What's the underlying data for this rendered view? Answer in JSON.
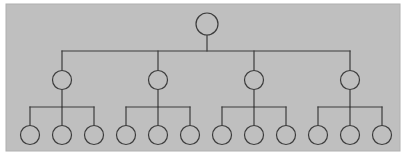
{
  "figure": {
    "kind": "tree-diagram",
    "title": "",
    "caption": ""
  },
  "canvas": {
    "width": 415,
    "height": 159,
    "background_color": "#ffffff"
  },
  "panel": {
    "x": 6,
    "y": 4,
    "width": 394,
    "height": 147,
    "fill_color": "#bfbfbf",
    "border_color": "#b0b0b0",
    "border_width": 1
  },
  "style": {
    "stroke_color": "#3c3c3c",
    "stroke_width": 1.2,
    "node_fill": "#bfbfbf",
    "node_stroke": "#3c3c3c",
    "node_stroke_width": 1.2
  },
  "chart_data": {
    "type": "tree",
    "levels": 3,
    "node_radius": {
      "root": 11,
      "level2": 9.5,
      "leaf": 9.5
    },
    "level_y": {
      "root": 24,
      "level2": 80,
      "leaf": 135
    },
    "connector_y": {
      "root_bar": 51,
      "branch_bar": 107
    },
    "nodes": {
      "root": [
        {
          "id": "r",
          "label": "",
          "x": 207,
          "y": 24,
          "r": 11
        }
      ],
      "level2": [
        {
          "id": "b1",
          "label": "",
          "x": 62,
          "y": 80,
          "r": 9.5
        },
        {
          "id": "b2",
          "label": "",
          "x": 158,
          "y": 80,
          "r": 9.5
        },
        {
          "id": "b3",
          "label": "",
          "x": 254,
          "y": 80,
          "r": 9.5
        },
        {
          "id": "b4",
          "label": "",
          "x": 350,
          "y": 80,
          "r": 9.5
        }
      ],
      "leaves": [
        {
          "id": "l1",
          "label": "",
          "x": 30,
          "y": 135,
          "r": 9.5,
          "parent": "b1"
        },
        {
          "id": "l2",
          "label": "",
          "x": 62,
          "y": 135,
          "r": 9.5,
          "parent": "b1"
        },
        {
          "id": "l3",
          "label": "",
          "x": 94,
          "y": 135,
          "r": 9.5,
          "parent": "b1"
        },
        {
          "id": "l4",
          "label": "",
          "x": 126,
          "y": 135,
          "r": 9.5,
          "parent": "b2"
        },
        {
          "id": "l5",
          "label": "",
          "x": 158,
          "y": 135,
          "r": 9.5,
          "parent": "b2"
        },
        {
          "id": "l6",
          "label": "",
          "x": 190,
          "y": 135,
          "r": 9.5,
          "parent": "b2"
        },
        {
          "id": "l7",
          "label": "",
          "x": 222,
          "y": 135,
          "r": 9.5,
          "parent": "b3"
        },
        {
          "id": "l8",
          "label": "",
          "x": 254,
          "y": 135,
          "r": 9.5,
          "parent": "b3"
        },
        {
          "id": "l9",
          "label": "",
          "x": 286,
          "y": 135,
          "r": 9.5,
          "parent": "b3"
        },
        {
          "id": "l10",
          "label": "",
          "x": 318,
          "y": 135,
          "r": 9.5,
          "parent": "b4"
        },
        {
          "id": "l11",
          "label": "",
          "x": 350,
          "y": 135,
          "r": 9.5,
          "parent": "b4"
        },
        {
          "id": "l12",
          "label": "",
          "x": 382,
          "y": 135,
          "r": 9.5,
          "parent": "b4"
        }
      ]
    },
    "edges": [
      {
        "id": "e-root-stem",
        "kind": "vertical",
        "x1": 207,
        "y1": 35,
        "x2": 207,
        "y2": 51
      },
      {
        "id": "e-root-bar",
        "kind": "horizontal",
        "x1": 62,
        "y1": 51,
        "x2": 350,
        "y2": 51
      },
      {
        "id": "e-b1-stem",
        "kind": "vertical",
        "x1": 62,
        "y1": 51,
        "x2": 62,
        "y2": 70.5
      },
      {
        "id": "e-b2-stem",
        "kind": "vertical",
        "x1": 158,
        "y1": 51,
        "x2": 158,
        "y2": 70.5
      },
      {
        "id": "e-b3-stem",
        "kind": "vertical",
        "x1": 254,
        "y1": 51,
        "x2": 254,
        "y2": 70.5
      },
      {
        "id": "e-b4-stem",
        "kind": "vertical",
        "x1": 350,
        "y1": 51,
        "x2": 350,
        "y2": 70.5
      },
      {
        "id": "e-b1-drop",
        "kind": "vertical",
        "x1": 62,
        "y1": 89.5,
        "x2": 62,
        "y2": 107
      },
      {
        "id": "e-b2-drop",
        "kind": "vertical",
        "x1": 158,
        "y1": 89.5,
        "x2": 158,
        "y2": 107
      },
      {
        "id": "e-b3-drop",
        "kind": "vertical",
        "x1": 254,
        "y1": 89.5,
        "x2": 254,
        "y2": 107
      },
      {
        "id": "e-b4-drop",
        "kind": "vertical",
        "x1": 350,
        "y1": 89.5,
        "x2": 350,
        "y2": 107
      },
      {
        "id": "e-g1-bar",
        "kind": "horizontal",
        "x1": 30,
        "y1": 107,
        "x2": 94,
        "y2": 107
      },
      {
        "id": "e-g2-bar",
        "kind": "horizontal",
        "x1": 126,
        "y1": 107,
        "x2": 190,
        "y2": 107
      },
      {
        "id": "e-g3-bar",
        "kind": "horizontal",
        "x1": 222,
        "y1": 107,
        "x2": 286,
        "y2": 107
      },
      {
        "id": "e-g4-bar",
        "kind": "horizontal",
        "x1": 318,
        "y1": 107,
        "x2": 382,
        "y2": 107
      },
      {
        "id": "e-l1-stem",
        "kind": "vertical",
        "x1": 30,
        "y1": 107,
        "x2": 30,
        "y2": 125.5
      },
      {
        "id": "e-l2-stem",
        "kind": "vertical",
        "x1": 62,
        "y1": 107,
        "x2": 62,
        "y2": 125.5
      },
      {
        "id": "e-l3-stem",
        "kind": "vertical",
        "x1": 94,
        "y1": 107,
        "x2": 94,
        "y2": 125.5
      },
      {
        "id": "e-l4-stem",
        "kind": "vertical",
        "x1": 126,
        "y1": 107,
        "x2": 126,
        "y2": 125.5
      },
      {
        "id": "e-l5-stem",
        "kind": "vertical",
        "x1": 158,
        "y1": 107,
        "x2": 158,
        "y2": 125.5
      },
      {
        "id": "e-l6-stem",
        "kind": "vertical",
        "x1": 190,
        "y1": 107,
        "x2": 190,
        "y2": 125.5
      },
      {
        "id": "e-l7-stem",
        "kind": "vertical",
        "x1": 222,
        "y1": 107,
        "x2": 222,
        "y2": 125.5
      },
      {
        "id": "e-l8-stem",
        "kind": "vertical",
        "x1": 254,
        "y1": 107,
        "x2": 254,
        "y2": 125.5
      },
      {
        "id": "e-l9-stem",
        "kind": "vertical",
        "x1": 286,
        "y1": 107,
        "x2": 286,
        "y2": 125.5
      },
      {
        "id": "e-l10-stem",
        "kind": "vertical",
        "x1": 318,
        "y1": 107,
        "x2": 318,
        "y2": 125.5
      },
      {
        "id": "e-l11-stem",
        "kind": "vertical",
        "x1": 350,
        "y1": 107,
        "x2": 350,
        "y2": 125.5
      },
      {
        "id": "e-l12-stem",
        "kind": "vertical",
        "x1": 382,
        "y1": 107,
        "x2": 382,
        "y2": 125.5
      }
    ]
  }
}
